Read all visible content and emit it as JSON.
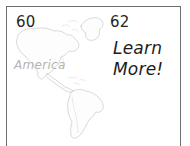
{
  "document": {
    "type": "scanned-book-spread",
    "background_color": "#ffffff",
    "frame_color": "#6e6e6e"
  },
  "page_numbers": {
    "left": "60",
    "right": "62",
    "color": "#262626"
  },
  "map": {
    "label": "America",
    "label_color": "#b4b4b4",
    "outline_color": "#c9c9c9",
    "fill_color": "#fdfdfd",
    "regions": [
      "Greenland",
      "North America",
      "Central America",
      "Caribbean",
      "South America"
    ]
  },
  "cta": {
    "line1": "Learn",
    "line2": "More!",
    "color": "#1c1c1c"
  }
}
